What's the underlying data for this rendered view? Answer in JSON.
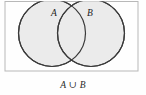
{
  "figure": {
    "type": "venn-diagram",
    "title": "",
    "caption": "A ∪ B",
    "universe_rect": {
      "x": 5,
      "y": 1.5,
      "width": 133,
      "height": 69.5,
      "border_color": "#b8b8b8",
      "fill_color": "#fefefe",
      "border_width": 1
    },
    "sets": [
      {
        "id": "set-a",
        "label": "A",
        "label_x": 54,
        "label_y": 16,
        "cx": 52,
        "cy": 33,
        "r": 33.5,
        "fill_color": "#ebebeb",
        "stroke_color": "#3a3a3a",
        "stroke_width": 1.2,
        "shaded": true
      },
      {
        "id": "set-b",
        "label": "B",
        "label_x": 90,
        "label_y": 16,
        "cx": 91,
        "cy": 33,
        "r": 33.5,
        "fill_color": "#ebebeb",
        "stroke_color": "#3a3a3a",
        "stroke_width": 1.2,
        "shaded": true
      }
    ],
    "caption_x": 73,
    "caption_y": 88,
    "shaded_region": "union",
    "shaded_region_description": "Both circles entirely shaded, representing A union B"
  }
}
